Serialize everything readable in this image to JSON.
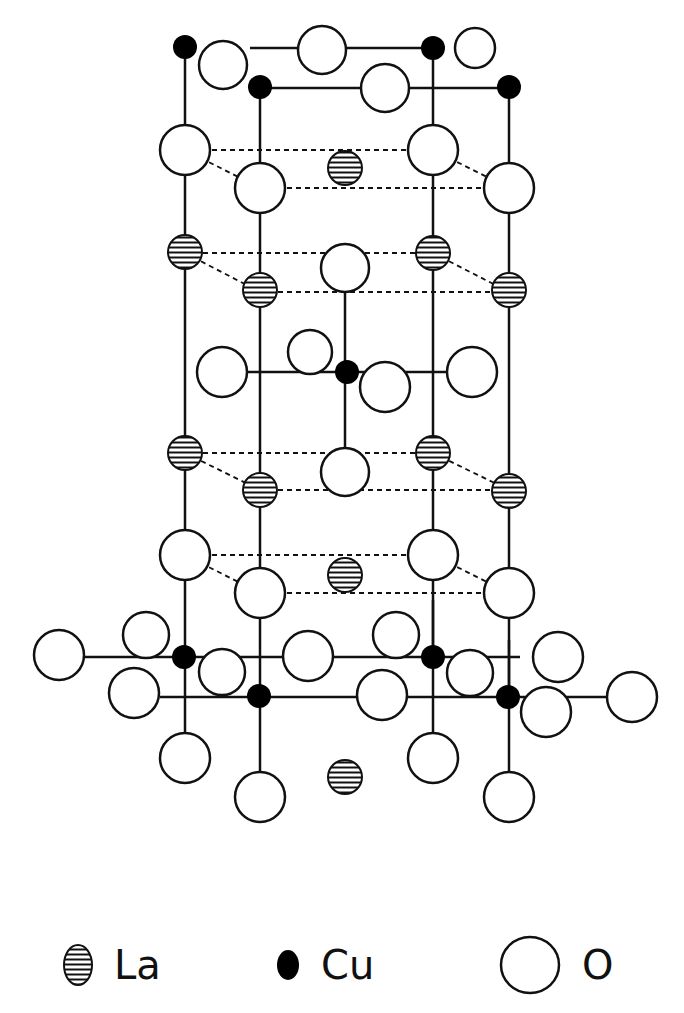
{
  "figure": {
    "colors": {
      "line": "#111111",
      "background": "#ffffff",
      "cu_fill": "#000000",
      "o_fill": "#ffffff"
    }
  },
  "legend": {
    "items": [
      {
        "symbol": "hatched-circle",
        "label": "La"
      },
      {
        "symbol": "filled-circle",
        "label": "Cu"
      },
      {
        "symbol": "open-circle",
        "label": "O"
      }
    ]
  },
  "atoms": {
    "La": [
      [
        345,
        168
      ],
      [
        185,
        253
      ],
      [
        260,
        292
      ],
      [
        433,
        253
      ],
      [
        509,
        292
      ],
      [
        185,
        453
      ],
      [
        260,
        490
      ],
      [
        433,
        453
      ],
      [
        509,
        490
      ],
      [
        345,
        575
      ],
      [
        345,
        777
      ]
    ],
    "Cu": [
      [
        185,
        48
      ],
      [
        260,
        88
      ],
      [
        433,
        48
      ],
      [
        509,
        88
      ],
      [
        345,
        372
      ],
      [
        185,
        657
      ],
      [
        260,
        697
      ],
      [
        433,
        657
      ],
      [
        509,
        697
      ]
    ],
    "O": [
      [
        322,
        50
      ],
      [
        233,
        66
      ],
      [
        398,
        88
      ],
      [
        475,
        48
      ],
      [
        185,
        150
      ],
      [
        260,
        188
      ],
      [
        433,
        150
      ],
      [
        509,
        188
      ],
      [
        345,
        270
      ],
      [
        222,
        372
      ],
      [
        303,
        355
      ],
      [
        405,
        383
      ],
      [
        477,
        372
      ],
      [
        345,
        470
      ],
      [
        185,
        555
      ],
      [
        260,
        593
      ],
      [
        433,
        555
      ],
      [
        509,
        593
      ],
      [
        60,
        655
      ],
      [
        145,
        640
      ],
      [
        135,
        693
      ],
      [
        215,
        682
      ],
      [
        310,
        658
      ],
      [
        398,
        637
      ],
      [
        360,
        697
      ],
      [
        475,
        657
      ],
      [
        422,
        673
      ],
      [
        545,
        697
      ],
      [
        625,
        697
      ],
      [
        185,
        757
      ],
      [
        260,
        797
      ],
      [
        433,
        757
      ],
      [
        509,
        797
      ],
      [
        260,
        600
      ],
      [
        509,
        600
      ]
    ]
  }
}
